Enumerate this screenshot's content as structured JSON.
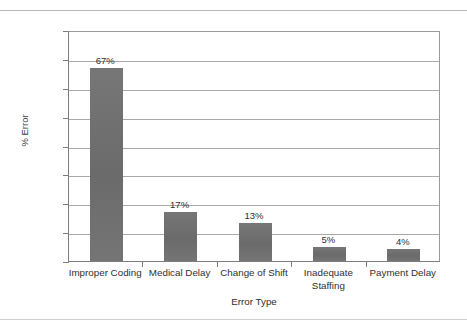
{
  "chart_data": {
    "type": "bar",
    "title": "",
    "categories": [
      "Improper Coding",
      "Medical Delay",
      "Change of Shift",
      "Inadequate Staffing",
      "Payment Delay"
    ],
    "category_lines": [
      [
        "Improper Coding"
      ],
      [
        "Medical Delay"
      ],
      [
        "Change of Shift"
      ],
      [
        "Inadequate",
        "Staffing"
      ],
      [
        "Payment Delay"
      ]
    ],
    "values": [
      67,
      17,
      13,
      5,
      4
    ],
    "data_labels": [
      "67%",
      "17%",
      "13%",
      "5%",
      "4%"
    ],
    "xlabel": "Error Type",
    "ylabel": "% Error",
    "ylim": [
      0,
      80
    ],
    "ytick_step": 10,
    "ytick_labels": [
      "0%",
      "10%",
      "20%",
      "30%",
      "40%",
      "50%",
      "60%",
      "70%",
      "80%"
    ],
    "ytick_values": [
      0,
      10,
      20,
      30,
      40,
      50,
      60,
      70,
      80
    ],
    "grid": true,
    "grid_axis": "y",
    "legend": false,
    "legend_position": "none",
    "bar_color": "#6f6f6f",
    "gridline_color": "#a9a9a9",
    "axis_color": "#7d7d7d",
    "text_color": "#2f2f2f"
  }
}
